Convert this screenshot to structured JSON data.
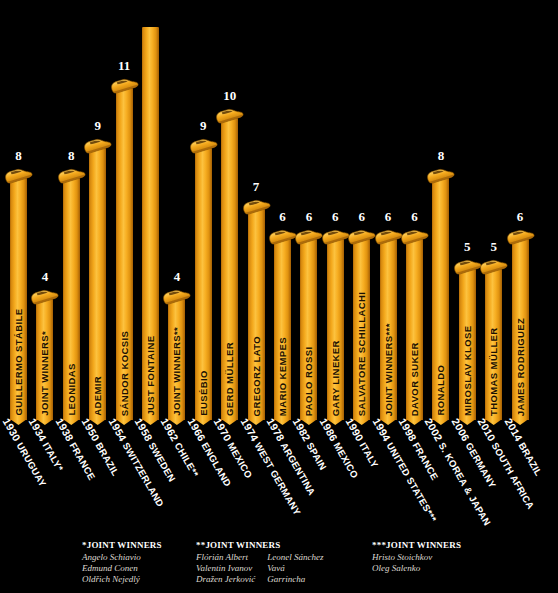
{
  "chart_data": {
    "type": "bar",
    "title": "",
    "xlabel": "",
    "ylabel": "",
    "ylim": [
      0,
      13
    ],
    "grid": false,
    "legend": null,
    "categories": [
      "1930 URUGUAY",
      "1934 ITALY*",
      "1938 FRANCE",
      "1950 BRAZIL",
      "1954 SWITZERLAND",
      "1958 SWEDEN",
      "1962 CHILE**",
      "1966 ENGLAND",
      "1970 MEXICO",
      "1974 WEST GERMANY",
      "1978 ARGENTINA",
      "1982 SPAIN",
      "1986 MEXICO",
      "1990 ITALY",
      "1994 UNITED STATES***",
      "1998 FRANCE",
      "2002 S. KOREA & JAPAN",
      "2006 GERMANY",
      "2010 SOUTH AFRICA",
      "2014 BRAZIL"
    ],
    "values": [
      8,
      4,
      8,
      9,
      11,
      13,
      4,
      9,
      10,
      7,
      6,
      6,
      6,
      6,
      6,
      6,
      8,
      5,
      5,
      6
    ],
    "bars": [
      {
        "year": "1930",
        "country": "URUGUAY",
        "player": "GUILLERMO STÁBILE",
        "goals": 8,
        "value_label": "8",
        "show_value": true,
        "show_boot": true
      },
      {
        "year": "1934",
        "country": "ITALY*",
        "player": "JOINT WINNERS*",
        "goals": 4,
        "value_label": "4",
        "show_value": true,
        "show_boot": true
      },
      {
        "year": "1938",
        "country": "FRANCE",
        "player": "LEONIDAS",
        "goals": 8,
        "value_label": "8",
        "show_value": true,
        "show_boot": true
      },
      {
        "year": "1950",
        "country": "BRAZIL",
        "player": "ADEMIR",
        "goals": 9,
        "value_label": "9",
        "show_value": true,
        "show_boot": true
      },
      {
        "year": "1954",
        "country": "SWITZERLAND",
        "player": "SÁNDOR KOCSIS",
        "goals": 11,
        "value_label": "11",
        "show_value": true,
        "show_boot": true
      },
      {
        "year": "1958",
        "country": "SWEDEN",
        "player": "JUST FONTAINE",
        "goals": 13,
        "value_label": "",
        "show_value": false,
        "show_boot": false
      },
      {
        "year": "1962",
        "country": "CHILE**",
        "player": "JOINT WINNERS**",
        "goals": 4,
        "value_label": "4",
        "show_value": true,
        "show_boot": true
      },
      {
        "year": "1966",
        "country": "ENGLAND",
        "player": "EUSÉBIO",
        "goals": 9,
        "value_label": "9",
        "show_value": true,
        "show_boot": true
      },
      {
        "year": "1970",
        "country": "MEXICO",
        "player": "GERD MÜLLER",
        "goals": 10,
        "value_label": "10",
        "show_value": true,
        "show_boot": true
      },
      {
        "year": "1974",
        "country": "WEST GERMANY",
        "player": "GREGORZ LATO",
        "goals": 7,
        "value_label": "7",
        "show_value": true,
        "show_boot": true
      },
      {
        "year": "1978",
        "country": "ARGENTINA",
        "player": "MARIO KEMPES",
        "goals": 6,
        "value_label": "6",
        "show_value": true,
        "show_boot": true
      },
      {
        "year": "1982",
        "country": "SPAIN",
        "player": "PAOLO ROSSI",
        "goals": 6,
        "value_label": "6",
        "show_value": true,
        "show_boot": true
      },
      {
        "year": "1986",
        "country": "MEXICO",
        "player": "GARY LINEKER",
        "goals": 6,
        "value_label": "6",
        "show_value": true,
        "show_boot": true
      },
      {
        "year": "1990",
        "country": "ITALY",
        "player": "SALVATORE SCHILLACHI",
        "goals": 6,
        "value_label": "6",
        "show_value": true,
        "show_boot": true
      },
      {
        "year": "1994",
        "country": "UNITED STATES***",
        "player": "JOINT WINNERS***",
        "goals": 6,
        "value_label": "6",
        "show_value": true,
        "show_boot": true
      },
      {
        "year": "1998",
        "country": "FRANCE",
        "player": "DAVOR SUKER",
        "goals": 6,
        "value_label": "6",
        "show_value": true,
        "show_boot": true
      },
      {
        "year": "2002",
        "country": "S. KOREA & JAPAN",
        "player": "RONALDO",
        "goals": 8,
        "value_label": "8",
        "show_value": true,
        "show_boot": true
      },
      {
        "year": "2006",
        "country": "GERMANY",
        "player": "MIROSLAV KLOSE",
        "goals": 5,
        "value_label": "5",
        "show_value": true,
        "show_boot": true
      },
      {
        "year": "2010",
        "country": "SOUTH AFRICA",
        "player": "THOMAS MÜLLER",
        "goals": 5,
        "value_label": "5",
        "show_value": true,
        "show_boot": true
      },
      {
        "year": "2014",
        "country": "BRAZIL",
        "player": "JAMES RODRIGUEZ",
        "goals": 6,
        "value_label": "6",
        "show_value": true,
        "show_boot": true
      }
    ]
  },
  "colors": {
    "background": "#000000",
    "bar": "#f3a81c",
    "bar_highlight": "#fcc23f",
    "bar_shadow": "#a45f05",
    "value_text": "#ffffff",
    "bar_label_text": "#1a1003",
    "axis_text": "#ffffff",
    "note_text": "#ded9d1"
  },
  "notes": [
    {
      "heading": "*JOINT WINNERS",
      "columns": [
        [
          "Angelo Schiavio",
          "Edmund Conen",
          "Oldřich Nejedlý"
        ]
      ]
    },
    {
      "heading": "**JOINT WINNERS",
      "columns": [
        [
          "Flórián Albert",
          "Valentin Ivanov",
          "Dražen Jerković"
        ],
        [
          "Leonel Sánchez",
          "Vavá",
          "Garrincha"
        ]
      ]
    },
    {
      "heading": "***JOINT WINNERS",
      "columns": [
        [
          "Hristo Stoichkov",
          "Oleg Salenko"
        ]
      ]
    }
  ]
}
